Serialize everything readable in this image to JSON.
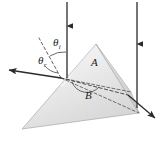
{
  "figure": {
    "type": "optics-prism-diagram",
    "title": "",
    "labels": {
      "theta_i": "θ",
      "theta_i_sub": "i",
      "theta_r": "θ",
      "theta_r_sub": "r",
      "angle_a": "A",
      "angle_b": "B"
    },
    "colors": {
      "ray": "#2b2b2b",
      "dashed": "#555555",
      "prism_light": "#f2f2f2",
      "prism_mid": "#e2e2e2",
      "prism_dark": "#c9c9c9",
      "outline": "#9a9a9a",
      "background": "#ffffff",
      "text": "#1a1a1a"
    },
    "elements": {
      "incident_ray": "vertical-down-left",
      "reflected_ray": "horizontal-left",
      "second_ray": "vertical-down-right",
      "exit_ray": "down-right",
      "normal_line": "dashed-up-left",
      "internal_ray": "dashed",
      "hidden_edges": "dashed"
    }
  }
}
